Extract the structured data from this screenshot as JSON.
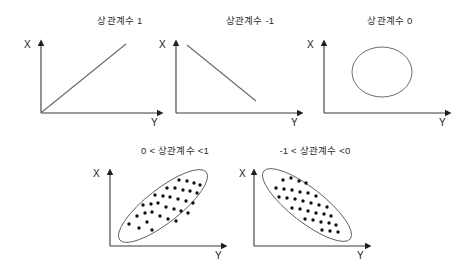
{
  "figure": {
    "background_color": "#ffffff",
    "axis_color": "#3a3a3a",
    "line_color": "#6a6a6a",
    "outline_color": "#5d5d5d",
    "dot_color": "#111111",
    "axis_label_x": "X",
    "axis_label_y": "Y"
  },
  "panels": [
    {
      "id": "correlation-1",
      "title": "상관계수 1",
      "x_label": "X",
      "y_label": "Y",
      "plot_type": "line"
    },
    {
      "id": "correlation-minus-1",
      "title": "상관계수 -1",
      "x_label": "X",
      "y_label": "Y",
      "plot_type": "line"
    },
    {
      "id": "correlation-0",
      "title": "상관계수 0",
      "x_label": "X",
      "y_label": "Y",
      "plot_type": "circle"
    },
    {
      "id": "correlation-positive",
      "title": "0 < 상관계수 <1",
      "x_label": "X",
      "y_label": "Y",
      "plot_type": "scatter-ellipse"
    },
    {
      "id": "correlation-negative",
      "title": "-1 < 상관계수 <0",
      "x_label": "X",
      "y_label": "Y",
      "plot_type": "scatter-ellipse"
    }
  ],
  "chart_data": {
    "type": "scatter",
    "xlabel": "Y",
    "ylabel": "X",
    "grid": false,
    "legend": "none",
    "panels": [
      {
        "name": "상관계수 1",
        "correlation": 1.0,
        "shape": "line",
        "line": {
          "x1": 41,
          "y1": 113,
          "x2": 126,
          "y2": 44
        },
        "description": "완전 양의 상관: 원점에서 우상향하는 직선"
      },
      {
        "name": "상관계수 -1",
        "correlation": -1.0,
        "shape": "line",
        "line": {
          "x1": 187,
          "y1": 45,
          "x2": 256,
          "y2": 101
        },
        "description": "완전 음의 상관: 좌상단에서 우하향하는 직선"
      },
      {
        "name": "상관계수 0",
        "correlation": 0.0,
        "shape": "circle",
        "ellipse": {
          "cx": 382,
          "cy": 72,
          "rx": 30,
          "ry": 25,
          "rotation": 0
        },
        "description": "상관 없음: 원형 산포"
      },
      {
        "name": "0 < 상관계수 <1",
        "correlation": 0.7,
        "shape": "scatter-ellipse",
        "ellipse": {
          "cx": 163,
          "cy": 206,
          "rx": 55,
          "ry": 17,
          "rotation": -38
        },
        "points": [
          [
            129,
            224
          ],
          [
            139,
            228
          ],
          [
            147,
            222
          ],
          [
            152,
            230
          ],
          [
            137,
            216
          ],
          [
            145,
            213
          ],
          [
            152,
            212
          ],
          [
            160,
            216
          ],
          [
            168,
            219
          ],
          [
            176,
            221
          ],
          [
            143,
            205
          ],
          [
            151,
            204
          ],
          [
            158,
            203
          ],
          [
            166,
            207
          ],
          [
            174,
            209
          ],
          [
            181,
            211
          ],
          [
            188,
            213
          ],
          [
            155,
            195
          ],
          [
            163,
            196
          ],
          [
            170,
            197
          ],
          [
            178,
            199
          ],
          [
            186,
            201
          ],
          [
            193,
            203
          ],
          [
            167,
            188
          ],
          [
            175,
            188
          ],
          [
            183,
            190
          ],
          [
            190,
            191
          ],
          [
            197,
            193
          ],
          [
            179,
            180
          ],
          [
            187,
            181
          ],
          [
            194,
            183
          ],
          [
            200,
            185
          ]
        ],
        "description": "양의 상관: 우상향 기울어진 타원 내 점 산포"
      },
      {
        "name": "-1 < 상관계수 <0",
        "correlation": -0.7,
        "shape": "scatter-ellipse",
        "ellipse": {
          "cx": 307,
          "cy": 205,
          "rx": 55,
          "ry": 17,
          "rotation": 38
        },
        "points": [
          [
            283,
            180
          ],
          [
            291,
            178
          ],
          [
            299,
            181
          ],
          [
            306,
            183
          ],
          [
            276,
            188
          ],
          [
            284,
            189
          ],
          [
            292,
            190
          ],
          [
            300,
            192
          ],
          [
            308,
            193
          ],
          [
            316,
            196
          ],
          [
            279,
            197
          ],
          [
            287,
            198
          ],
          [
            295,
            199
          ],
          [
            303,
            201
          ],
          [
            311,
            203
          ],
          [
            319,
            205
          ],
          [
            327,
            207
          ],
          [
            292,
            208
          ],
          [
            300,
            209
          ],
          [
            308,
            211
          ],
          [
            316,
            213
          ],
          [
            324,
            214
          ],
          [
            331,
            216
          ],
          [
            305,
            219
          ],
          [
            313,
            220
          ],
          [
            321,
            222
          ],
          [
            329,
            223
          ],
          [
            336,
            225
          ],
          [
            322,
            230
          ],
          [
            330,
            231
          ],
          [
            338,
            232
          ]
        ],
        "description": "음의 상관: 우하향 기울어진 타원 내 점 산포"
      }
    ]
  }
}
